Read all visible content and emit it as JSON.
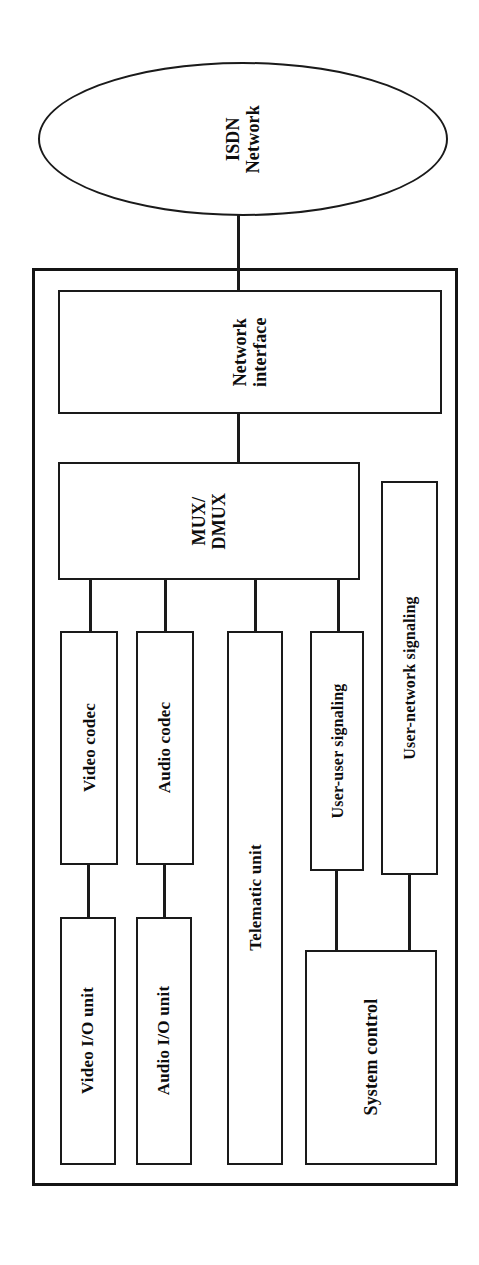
{
  "diagram": {
    "title": "ISDN videoconferencing terminal block diagram",
    "orientation": "rotated-90-ccw",
    "line_color": "#1a1a1a",
    "background_color": "#ffffff"
  },
  "network": {
    "label_line1": "ISDN",
    "label_line2": "Network"
  },
  "terminal": {
    "frame_label": "Terminal equipment"
  },
  "nodes": {
    "network_interface": "Network interface",
    "mux_dmux_line1": "MUX/",
    "mux_dmux_line2": "DMUX",
    "video_codec": "Video codec",
    "audio_codec": "Audio codec",
    "telematic_unit": "Telematic unit",
    "user_user_signaling": "User-user signaling",
    "user_network_signaling": "User-network signaling",
    "video_io_unit": "Video I/O unit",
    "audio_io_unit": "Audio I/O unit",
    "system_control": "System control"
  },
  "connections": [
    {
      "from": "ISDN Network",
      "to": "Network interface"
    },
    {
      "from": "Network interface",
      "to": "MUX/DMUX"
    },
    {
      "from": "MUX/DMUX",
      "to": "Video codec"
    },
    {
      "from": "MUX/DMUX",
      "to": "Audio codec"
    },
    {
      "from": "MUX/DMUX",
      "to": "Telematic unit"
    },
    {
      "from": "MUX/DMUX",
      "to": "User-user signaling"
    },
    {
      "from": "Video codec",
      "to": "Video I/O unit"
    },
    {
      "from": "Audio codec",
      "to": "Audio I/O unit"
    },
    {
      "from": "User-user signaling",
      "to": "System control"
    },
    {
      "from": "User-network signaling",
      "to": "System control"
    },
    {
      "from": "ISDN Network",
      "to": "User-network signaling"
    }
  ]
}
